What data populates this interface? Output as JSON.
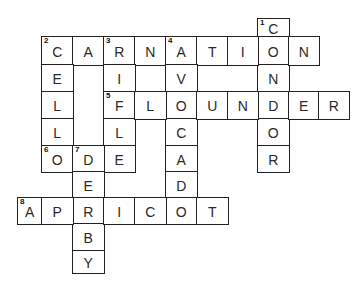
{
  "puzzle": {
    "title": "",
    "layout": {
      "col_x": [
        17,
        41,
        72,
        103,
        134,
        165,
        196,
        227,
        257,
        288,
        318,
        348
      ],
      "row_y": [
        18,
        36,
        64,
        91,
        118,
        145,
        171,
        197,
        223,
        250,
        272
      ]
    },
    "words": [
      {
        "number": 1,
        "direction": "down",
        "answer": "CONDOR",
        "col": 7,
        "row": 0
      },
      {
        "number": 2,
        "direction": "across",
        "answer": "CARNATION",
        "col": 0,
        "row": 1
      },
      {
        "number": 2,
        "direction": "down",
        "answer": "CELL",
        "col": 0,
        "row": 1
      },
      {
        "number": 3,
        "direction": "down",
        "answer": "RIFLE",
        "col": 2,
        "row": 1
      },
      {
        "number": 4,
        "direction": "down",
        "answer": "AVOCADO",
        "col": 4,
        "row": 1
      },
      {
        "number": 5,
        "direction": "across",
        "answer": "FLOUNDER",
        "col": 2,
        "row": 3
      },
      {
        "number": 6,
        "direction": "across",
        "answer": "ODE",
        "col": 0,
        "row": 5
      },
      {
        "number": 7,
        "direction": "down",
        "answer": "DERBY",
        "col": 1,
        "row": 5
      },
      {
        "number": 8,
        "direction": "across",
        "answer": "APRICOT",
        "col": -1,
        "row": 7
      }
    ]
  }
}
